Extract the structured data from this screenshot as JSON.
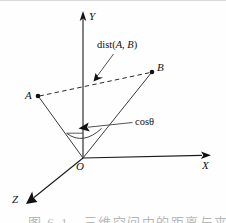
{
  "figure": {
    "kind": "3d-coordinate-diagram",
    "background_color": "#fefefe",
    "line_color": "#1a1a1a",
    "width": 226,
    "height": 223
  },
  "axes": [
    {
      "id": "y",
      "label": "Y",
      "direction": "up"
    },
    {
      "id": "x",
      "label": "X",
      "direction": "right"
    },
    {
      "id": "z",
      "label": "Z",
      "direction": "down-left"
    }
  ],
  "origin": {
    "label": "O"
  },
  "points": [
    {
      "id": "a",
      "label": "A"
    },
    {
      "id": "b",
      "label": "B"
    }
  ],
  "annotations": [
    {
      "id": "dist",
      "prefix": "dist(",
      "arg1": "A",
      "sep": ", ",
      "arg2": "B",
      "suffix": ")"
    },
    {
      "id": "cos",
      "text": "cosθ"
    }
  ],
  "caption": {
    "text": "图 6-1　三维空间中的距离与夹角余弦示意图"
  }
}
